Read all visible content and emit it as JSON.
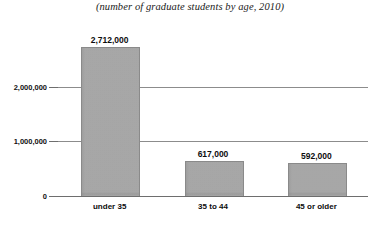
{
  "chart_data": {
    "type": "bar",
    "title": "(number of graduate students by age, 2010)",
    "xlabel": "",
    "ylabel": "",
    "categories": [
      "under 35",
      "35 to 44",
      "45 or older"
    ],
    "values": [
      2712000,
      617000,
      592000
    ],
    "value_labels": [
      "2,712,000",
      "617,000",
      "592,000"
    ],
    "ylim": [
      0,
      2862000
    ],
    "yticks": [
      0,
      1000000,
      2000000
    ],
    "ytick_labels": [
      "0",
      "1,000,000",
      "2,000,000"
    ],
    "grid": true,
    "grid_axis": "y",
    "legend": false,
    "bar_color": "#9e9e9e",
    "bar_edge_color": "#8a8a8a",
    "axis_color": "#6e6e6e",
    "grid_color": "#8c8c8c",
    "text_color": "#0d0d0d"
  }
}
